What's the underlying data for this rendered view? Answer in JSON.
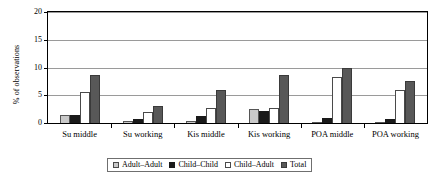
{
  "chart_data": {
    "type": "bar",
    "title": "",
    "subtitle": "",
    "xlabel": "",
    "ylabel": "% of observations",
    "ylim": [
      0,
      20
    ],
    "yticks": [
      0,
      5,
      10,
      15,
      20
    ],
    "ytick_labels": [
      "0",
      "5",
      "10",
      "15",
      "20"
    ],
    "grid": true,
    "legend_position": "bottom",
    "categories": [
      "Su middle",
      "Su working",
      "Kis middle",
      "Kis working",
      "POA middle",
      "POA working"
    ],
    "series": [
      {
        "name": "Adult–Adult",
        "color": "#c9c9c9",
        "values": [
          1.5,
          0.3,
          0.4,
          2.6,
          0.0,
          0.0
        ]
      },
      {
        "name": "Child–Child",
        "color": "#1a1a1a",
        "values": [
          1.5,
          0.7,
          1.2,
          2.1,
          0.9,
          0.8
        ]
      },
      {
        "name": "Child–Adult",
        "color": "#ffffff",
        "values": [
          5.6,
          2.0,
          2.7,
          2.7,
          8.3,
          6.0
        ]
      },
      {
        "name": "Total",
        "color": "#585858",
        "values": [
          8.7,
          3.0,
          6.0,
          8.7,
          10.0,
          7.5
        ]
      }
    ]
  },
  "legend": {
    "items": [
      {
        "label": "Adult–Adult"
      },
      {
        "label": "Child–Child"
      },
      {
        "label": "Child–Adult"
      },
      {
        "label": "Total"
      }
    ]
  }
}
